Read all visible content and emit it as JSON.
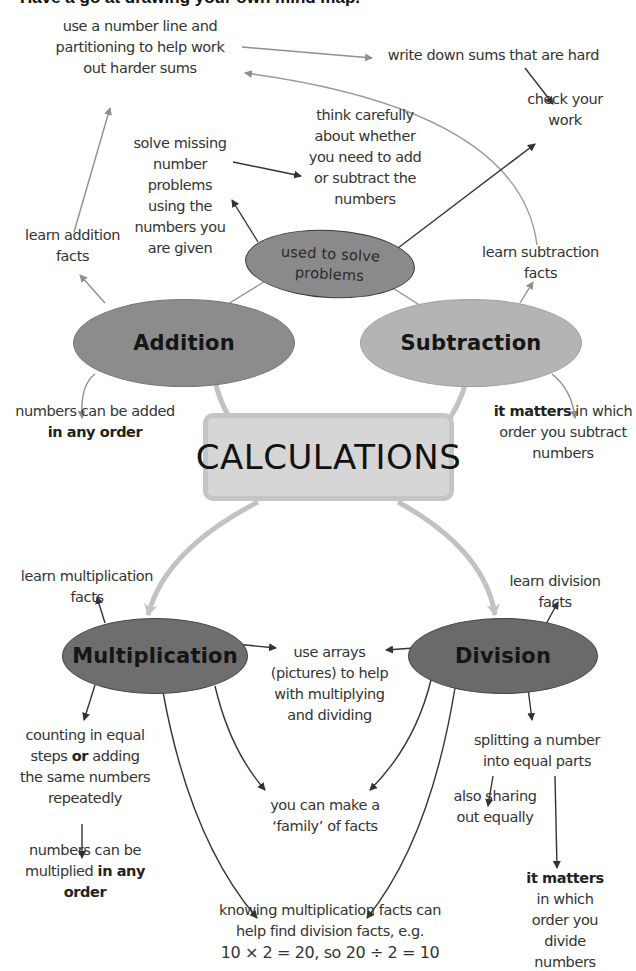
{
  "title": "Have a go at drawing your own mind map.",
  "central": {
    "label": "CALCULATIONS",
    "fill": "#d6d6d6",
    "border": "#c5c5c5"
  },
  "nodes": {
    "addition": {
      "label": "Addition",
      "fill": "#8c8c8c"
    },
    "subtraction": {
      "label": "Subtraction",
      "fill": "#b4b4b4"
    },
    "multiplication": {
      "label": "Multiplication",
      "fill": "#6e6e6e"
    },
    "division": {
      "label": "Division",
      "fill": "#6a6a6a"
    },
    "used_to_solve": {
      "label_line1": "used to solve",
      "label_line2": "problems",
      "fill": "#8a8a8a"
    }
  },
  "notes": {
    "number_line": [
      "use a number line and",
      "partitioning to help work",
      "out harder sums"
    ],
    "write_down": [
      "write down sums that are hard"
    ],
    "check_work": [
      "check your",
      "work"
    ],
    "solve_missing": [
      "solve missing",
      "number",
      "problems",
      "using the",
      "numbers you",
      "are given"
    ],
    "think_carefully": [
      "think carefully",
      "about whether",
      "you need to add",
      "or subtract the",
      "numbers"
    ],
    "learn_addition": [
      "learn addition",
      "facts"
    ],
    "learn_subtraction": [
      "learn subtraction",
      "facts"
    ],
    "added_any_order": {
      "line1": "numbers can be added",
      "line2_bold": "in any order"
    },
    "subtract_order": {
      "bold": "it matters",
      "line1_rest": " in which",
      "line2": "order you subtract",
      "line3": "numbers"
    },
    "learn_multiplication": [
      "learn multiplication",
      "facts"
    ],
    "learn_division": [
      "learn division",
      "facts"
    ],
    "use_arrays": [
      "use arrays",
      "(pictures) to help",
      "with multiplying",
      "and dividing"
    ],
    "counting_equal": {
      "line1": "counting in equal",
      "line2_pre": "steps ",
      "line2_bold": "or",
      "line2_post": " adding",
      "line3": "the same numbers",
      "line4": "repeatedly"
    },
    "multiplied_any_order": {
      "line1": "numbers can be",
      "line2_pre": "multiplied ",
      "line2_bold": "in any",
      "line3_bold": "order"
    },
    "family_facts": [
      "you can make a",
      "‘family’ of facts"
    ],
    "splitting": [
      "splitting a number",
      "into equal parts"
    ],
    "sharing": [
      "also sharing",
      "out equally"
    ],
    "divide_order": {
      "bold": "it matters",
      "line2": "in which",
      "line3": "order you",
      "line4": "divide",
      "line5": "numbers"
    },
    "knowing_facts": [
      "knowing multiplication facts can",
      "help find division facts, e.g.",
      "10 × 2 = 20, so 20 ÷ 2 = 10"
    ]
  },
  "colors": {
    "arrow_dark": "#333333",
    "arrow_grey": "#8f8f8f",
    "arrow_light": "#c2c2c2"
  }
}
